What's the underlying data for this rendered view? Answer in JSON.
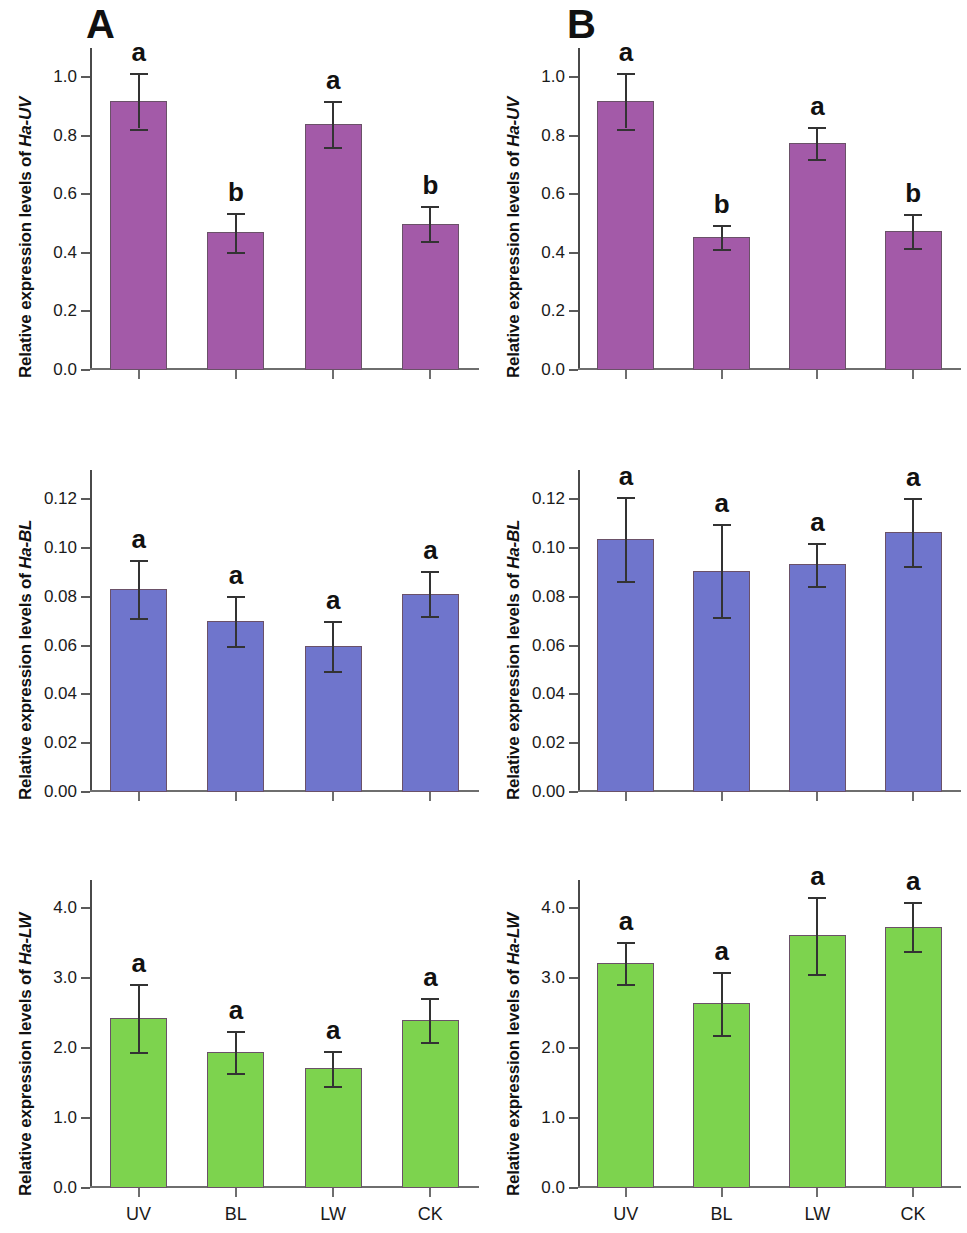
{
  "figure": {
    "panels": [
      {
        "id": "A",
        "label": "A"
      },
      {
        "id": "B",
        "label": "B"
      }
    ],
    "categories": [
      "UV",
      "BL",
      "LW",
      "CK"
    ],
    "colors": {
      "uv_bar": "#a35aa8",
      "bl_bar": "#6f75cc",
      "lw_bar": "#7dd34e",
      "axis": "#555555",
      "text": "#111111",
      "error_bar": "#333333"
    }
  },
  "chart_data": [
    {
      "id": "A-UV",
      "type": "bar",
      "panel": "A",
      "title": "",
      "xlabel": "",
      "ylabel": "Relative expression levels of Ha-UV",
      "ylabel_prefix": "Relative expression levels of ",
      "ylabel_gene": "Ha-UV",
      "categories": [
        "UV",
        "BL",
        "LW",
        "CK"
      ],
      "values": [
        0.92,
        0.47,
        0.84,
        0.5
      ],
      "errors": [
        0.095,
        0.067,
        0.079,
        0.06
      ],
      "sig_letters": [
        "a",
        "b",
        "a",
        "b"
      ],
      "ylim": [
        0.0,
        1.1
      ],
      "yticks": [
        0.0,
        0.2,
        0.4,
        0.6,
        0.8,
        1.0
      ],
      "ytick_labels": [
        "0.0",
        "0.2",
        "0.4",
        "0.6",
        "0.8",
        "1.0"
      ],
      "show_xticklabels": false,
      "grid": false,
      "bar_color": "#a35aa8"
    },
    {
      "id": "B-UV",
      "type": "bar",
      "panel": "B",
      "title": "",
      "xlabel": "",
      "ylabel": "Relative expression levels of Ha-UV",
      "ylabel_prefix": "Relative expression levels of ",
      "ylabel_gene": "Ha-UV",
      "categories": [
        "UV",
        "BL",
        "LW",
        "CK"
      ],
      "values": [
        0.92,
        0.455,
        0.775,
        0.475
      ],
      "errors": [
        0.095,
        0.04,
        0.055,
        0.058
      ],
      "sig_letters": [
        "a",
        "b",
        "a",
        "b"
      ],
      "ylim": [
        0.0,
        1.1
      ],
      "yticks": [
        0.0,
        0.2,
        0.4,
        0.6,
        0.8,
        1.0
      ],
      "ytick_labels": [
        "0.0",
        "0.2",
        "0.4",
        "0.6",
        "0.8",
        "1.0"
      ],
      "show_xticklabels": false,
      "grid": false,
      "bar_color": "#a35aa8"
    },
    {
      "id": "A-BL",
      "type": "bar",
      "panel": "A",
      "title": "",
      "xlabel": "",
      "ylabel": "Relative expression levels of Ha-BL",
      "ylabel_prefix": "Relative expression levels of ",
      "ylabel_gene": "Ha-BL",
      "categories": [
        "UV",
        "BL",
        "LW",
        "CK"
      ],
      "values": [
        0.0833,
        0.07,
        0.06,
        0.0813
      ],
      "errors": [
        0.012,
        0.0102,
        0.0103,
        0.0093
      ],
      "sig_letters": [
        "a",
        "a",
        "a",
        "a"
      ],
      "ylim": [
        0.0,
        0.132
      ],
      "yticks": [
        0.0,
        0.02,
        0.04,
        0.06,
        0.08,
        0.1,
        0.12
      ],
      "ytick_labels": [
        "0.00",
        "0.02",
        "0.04",
        "0.06",
        "0.08",
        "0.10",
        "0.12"
      ],
      "show_xticklabels": false,
      "grid": false,
      "bar_color": "#6f75cc"
    },
    {
      "id": "B-BL",
      "type": "bar",
      "panel": "B",
      "title": "",
      "xlabel": "",
      "ylabel": "Relative expression levels of Ha-BL",
      "ylabel_prefix": "Relative expression levels of ",
      "ylabel_gene": "Ha-BL",
      "categories": [
        "UV",
        "BL",
        "LW",
        "CK"
      ],
      "values": [
        0.1037,
        0.0907,
        0.0933,
        0.1067
      ],
      "errors": [
        0.0173,
        0.019,
        0.0087,
        0.014
      ],
      "sig_letters": [
        "a",
        "a",
        "a",
        "a"
      ],
      "ylim": [
        0.0,
        0.132
      ],
      "yticks": [
        0.0,
        0.02,
        0.04,
        0.06,
        0.08,
        0.1,
        0.12
      ],
      "ytick_labels": [
        "0.00",
        "0.02",
        "0.04",
        "0.06",
        "0.08",
        "0.10",
        "0.12"
      ],
      "show_xticklabels": false,
      "grid": false,
      "bar_color": "#6f75cc"
    },
    {
      "id": "A-LW",
      "type": "bar",
      "panel": "A",
      "title": "",
      "xlabel": "",
      "ylabel": "Relative expression levels of Ha-LW",
      "ylabel_prefix": "Relative expression levels of ",
      "ylabel_gene": "Ha-LW",
      "categories": [
        "UV",
        "BL",
        "LW",
        "CK"
      ],
      "values": [
        2.43,
        1.94,
        1.71,
        2.4
      ],
      "errors": [
        0.49,
        0.3,
        0.25,
        0.31
      ],
      "sig_letters": [
        "a",
        "a",
        "a",
        "a"
      ],
      "ylim": [
        0.0,
        4.4
      ],
      "yticks": [
        0.0,
        1.0,
        2.0,
        3.0,
        4.0
      ],
      "ytick_labels": [
        "0.0",
        "1.0",
        "2.0",
        "3.0",
        "4.0"
      ],
      "show_xticklabels": true,
      "grid": false,
      "bar_color": "#7dd34e"
    },
    {
      "id": "B-LW",
      "type": "bar",
      "panel": "B",
      "title": "",
      "xlabel": "",
      "ylabel": "Relative expression levels of Ha-LW",
      "ylabel_prefix": "Relative expression levels of ",
      "ylabel_gene": "Ha-LW",
      "categories": [
        "UV",
        "BL",
        "LW",
        "CK"
      ],
      "values": [
        3.21,
        2.64,
        3.61,
        3.73
      ],
      "errors": [
        0.3,
        0.45,
        0.55,
        0.35
      ],
      "sig_letters": [
        "a",
        "a",
        "a",
        "a"
      ],
      "ylim": [
        0.0,
        4.4
      ],
      "yticks": [
        0.0,
        1.0,
        2.0,
        3.0,
        4.0
      ],
      "ytick_labels": [
        "0.0",
        "1.0",
        "2.0",
        "3.0",
        "4.0"
      ],
      "show_xticklabels": true,
      "grid": false,
      "bar_color": "#7dd34e"
    }
  ]
}
